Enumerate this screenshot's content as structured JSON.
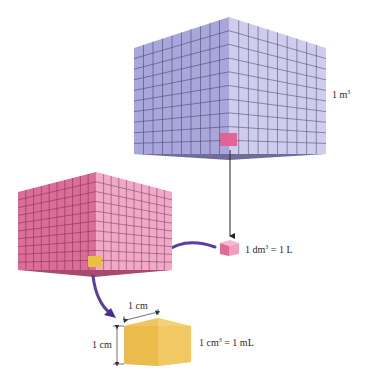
{
  "diagram": {
    "colors": {
      "m3_left": "#a9a6dc",
      "m3_right": "#cfcdee",
      "m3_bottom": "#6f6d9a",
      "dm3_left": "#dc6d98",
      "dm3_right": "#f0a9c6",
      "dm3_bottom": "#a84a70",
      "cm3_left": "#e8b43e",
      "cm3_right": "#f1cb6a",
      "cm3_top": "#f6d98a",
      "grid_line": "#2f2a4a",
      "arrow_purple": "#5a3fa0",
      "arrow_black": "#222222"
    },
    "cubes": [
      {
        "id": "cubic-meter",
        "label_prefix": "1 m",
        "label_sup": "3",
        "label_suffix": "",
        "grid": 10
      },
      {
        "id": "cubic-decimeter",
        "label_prefix": "1 dm",
        "label_sup": "3",
        "label_suffix": " = 1 L",
        "grid": 10
      },
      {
        "id": "cubic-centimeter",
        "label_prefix": "1 cm",
        "label_sup": "3",
        "label_suffix": " = 1 mL",
        "grid": 1
      }
    ],
    "dimensions": {
      "width_label": "1 cm",
      "height_label": "1 cm"
    }
  }
}
